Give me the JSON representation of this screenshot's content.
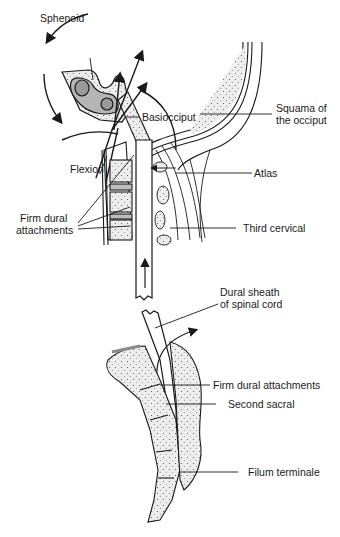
{
  "diagram": {
    "colors": {
      "ink": "#1a1a1a",
      "bone_fill": "#ededed",
      "sinus_fill": "#9a9a9a",
      "disc_fill": "#bdbdbd"
    },
    "labels": {
      "sphenoid": "Sphenoid",
      "basiocciput": "Basiocciput",
      "squama_line1": "Squama of",
      "squama_line2": "the occiput",
      "flexion": "Flexion",
      "atlas": "Atlas",
      "firm_dural_line1": "Firm dural",
      "firm_dural_line2": "attachments",
      "third_cervical": "Third cervical",
      "dural_sheath_line1": "Dural sheath",
      "dural_sheath_line2": "of spinal cord",
      "firm_dural_attachments": "Firm dural attachments",
      "second_sacral": "Second sacral",
      "filum_terminale": "Filum terminale"
    }
  }
}
